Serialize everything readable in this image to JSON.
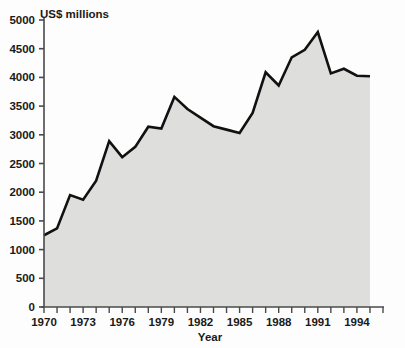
{
  "chart_data": {
    "type": "area",
    "title": "",
    "unit_label": "US$ millions",
    "xlabel": "Year",
    "ylabel": "",
    "xlim": [
      1970,
      1996
    ],
    "ylim": [
      0,
      5000
    ],
    "grid": false,
    "legend": "none",
    "y_ticks": [
      0,
      500,
      1000,
      1500,
      2000,
      2500,
      3000,
      3500,
      4000,
      4500,
      5000
    ],
    "y_tick_labels": [
      "0",
      "500",
      "1000",
      "1500",
      "2000",
      "2500",
      "3000",
      "3500",
      "4000",
      "4500",
      "5000"
    ],
    "x_ticks": [
      1970,
      1971,
      1972,
      1973,
      1974,
      1975,
      1976,
      1977,
      1978,
      1979,
      1980,
      1981,
      1982,
      1983,
      1984,
      1985,
      1986,
      1987,
      1988,
      1989,
      1990,
      1991,
      1992,
      1993,
      1994,
      1995,
      1996
    ],
    "x_tick_labels": [
      "1970",
      "",
      "",
      "1973",
      "",
      "",
      "1976",
      "",
      "",
      "1979",
      "",
      "",
      "1982",
      "",
      "",
      "1985",
      "",
      "",
      "1988",
      "",
      "",
      "1991",
      "",
      "",
      "1994",
      "",
      ""
    ],
    "x": [
      1970,
      1971,
      1972,
      1973,
      1974,
      1975,
      1976,
      1977,
      1978,
      1979,
      1980,
      1981,
      1982,
      1983,
      1984,
      1985,
      1986,
      1987,
      1988,
      1989,
      1990,
      1991,
      1992,
      1993,
      1994,
      1995
    ],
    "values": [
      1250,
      1370,
      1950,
      1870,
      2200,
      2890,
      2610,
      2790,
      3140,
      3110,
      3660,
      3450,
      3300,
      3150,
      3090,
      3030,
      3380,
      4090,
      3860,
      4350,
      4480,
      4790,
      4070,
      4150,
      4030,
      4020
    ],
    "series": [
      {
        "name": "US$ millions",
        "values": [
          1250,
          1370,
          1950,
          1870,
          2200,
          2890,
          2610,
          2790,
          3140,
          3110,
          3660,
          3450,
          3300,
          3150,
          3090,
          3030,
          3380,
          4090,
          3860,
          4350,
          4480,
          4790,
          4070,
          4150,
          4030,
          4020
        ]
      }
    ],
    "colors": {
      "line": "#111111",
      "fill": "#dededc",
      "axis": "#4a4a4a",
      "text": "#1a1a1a",
      "background": "#fdfdfd"
    }
  }
}
